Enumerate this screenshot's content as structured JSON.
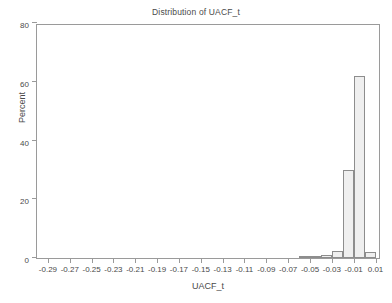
{
  "chart_data": {
    "type": "bar",
    "title": "Distribution of UACF_t",
    "xlabel": "UACF_t",
    "ylabel": "Percent",
    "grid": false,
    "legend": "none",
    "xlim": [
      -0.3,
      0.015
    ],
    "ylim": [
      0,
      80
    ],
    "yticks": [
      0,
      20,
      40,
      60,
      80
    ],
    "ytick_labels": [
      "0",
      "20",
      "40",
      "60",
      "80"
    ],
    "xticks": [
      -0.29,
      -0.27,
      -0.25,
      -0.23,
      -0.21,
      -0.19,
      -0.17,
      -0.15,
      -0.13,
      -0.11,
      -0.09,
      -0.07,
      -0.05,
      -0.03,
      -0.01,
      0.01
    ],
    "xtick_labels": [
      "-0.29",
      "-0.27",
      "-0.25",
      "-0.23",
      "-0.21",
      "-0.19",
      "-0.17",
      "-0.15",
      "-0.13",
      "-0.11",
      "-0.09",
      "-0.07",
      "-0.05",
      "-0.03",
      "-0.01",
      "0.01"
    ],
    "bin_width": 0.01,
    "bar_fill_color": "#efefef",
    "bar_edge_color": "#8d8d8d",
    "bins": [
      {
        "center": -0.055,
        "left": -0.06,
        "value": 0.4
      },
      {
        "center": -0.045,
        "left": -0.05,
        "value": 0.5
      },
      {
        "center": -0.035,
        "left": -0.04,
        "value": 1.1
      },
      {
        "center": -0.025,
        "left": -0.03,
        "value": 2.4
      },
      {
        "center": -0.015,
        "left": -0.02,
        "value": 29.8
      },
      {
        "center": -0.005,
        "left": -0.01,
        "value": 62.0
      },
      {
        "center": 0.005,
        "left": 0.0,
        "value": 2.2
      }
    ],
    "categories": [
      "-0.055",
      "-0.045",
      "-0.035",
      "-0.025",
      "-0.015",
      "-0.005",
      "0.005"
    ],
    "values": [
      0.4,
      0.5,
      1.1,
      2.4,
      29.8,
      62.0,
      2.2
    ]
  }
}
